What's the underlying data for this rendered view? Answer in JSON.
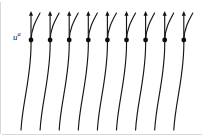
{
  "figure": {
    "domain": "Diagram",
    "background_color": "#ffffff",
    "ink_color": "#151515",
    "frame_color": "#d8d8d8",
    "width": 204,
    "height": 136
  },
  "labels": {
    "velocity_field": {
      "base": "u",
      "superscript": "a",
      "full_text": "uᵃ",
      "x": 13,
      "y": 33
    }
  },
  "geometry": {
    "unit_count": 9,
    "first_dot_x": 31,
    "dot_spacing": 19.1,
    "dot_y": 40,
    "dot_radius": 2.4,
    "arrow_tip_y": 11,
    "curve_bottom_y": 130,
    "bottom_offset_x": -10,
    "upper_branch_tip_x_offset": 9,
    "upper_branch_tip_y": 13
  },
  "units": [
    {
      "index": 1,
      "dot_x": 31.0,
      "dot_y": 40,
      "arrow_tip_y": 11,
      "bottom_x": 21.0,
      "bottom_y": 130,
      "branch_tip_x": 40.0,
      "branch_tip_y": 13
    },
    {
      "index": 2,
      "dot_x": 50.1,
      "dot_y": 40,
      "arrow_tip_y": 11,
      "bottom_x": 40.1,
      "bottom_y": 130,
      "branch_tip_x": 59.1,
      "branch_tip_y": 13
    },
    {
      "index": 3,
      "dot_x": 69.2,
      "dot_y": 40,
      "arrow_tip_y": 11,
      "bottom_x": 59.2,
      "bottom_y": 130,
      "branch_tip_x": 78.2,
      "branch_tip_y": 13
    },
    {
      "index": 4,
      "dot_x": 88.3,
      "dot_y": 40,
      "arrow_tip_y": 11,
      "bottom_x": 78.3,
      "bottom_y": 130,
      "branch_tip_x": 97.3,
      "branch_tip_y": 13
    },
    {
      "index": 5,
      "dot_x": 107.4,
      "dot_y": 40,
      "arrow_tip_y": 11,
      "bottom_x": 97.4,
      "bottom_y": 130,
      "branch_tip_x": 116.4,
      "branch_tip_y": 13
    },
    {
      "index": 6,
      "dot_x": 126.5,
      "dot_y": 40,
      "arrow_tip_y": 11,
      "bottom_x": 116.5,
      "bottom_y": 130,
      "branch_tip_x": 135.5,
      "branch_tip_y": 13
    },
    {
      "index": 7,
      "dot_x": 145.6,
      "dot_y": 40,
      "arrow_tip_y": 11,
      "bottom_x": 135.6,
      "bottom_y": 130,
      "branch_tip_x": 154.6,
      "branch_tip_y": 13
    },
    {
      "index": 8,
      "dot_x": 164.7,
      "dot_y": 40,
      "arrow_tip_y": 11,
      "bottom_x": 154.7,
      "bottom_y": 130,
      "branch_tip_x": 173.7,
      "branch_tip_y": 13
    },
    {
      "index": 9,
      "dot_x": 183.8,
      "dot_y": 40,
      "arrow_tip_y": 11,
      "bottom_x": 173.8,
      "bottom_y": 130,
      "branch_tip_x": 192.8,
      "branch_tip_y": 13
    }
  ]
}
